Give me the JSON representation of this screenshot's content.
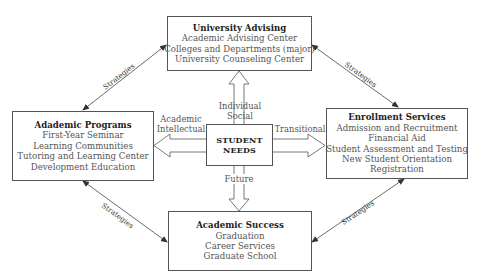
{
  "diagram": {
    "boxes": {
      "university_advising": {
        "title": "University Advising",
        "items": [
          "Academic Advising Center",
          "Colleges and Departments (major)",
          "University Counseling Center"
        ]
      },
      "academic_programs": {
        "title": "Adademic Programs",
        "items": [
          "First-Year Seminar",
          "Learning Communities",
          "Tutoring and Learning Center",
          "Development Education"
        ]
      },
      "student_needs": {
        "line1": "STUDENT",
        "line2": "NEEDS"
      },
      "enrollment_services": {
        "title": "Enrollment Services",
        "items": [
          "Admission and Recruitment",
          "Financial Aid",
          "Student Assessment and Testing",
          "New Student Orientation",
          "Registration"
        ]
      },
      "academic_success": {
        "title": "Academic Success",
        "items": [
          "Graduation",
          "Career Services",
          "Graduate School"
        ]
      }
    },
    "need_labels": {
      "up_1": "Individual",
      "up_2": "Social",
      "left_1": "Academic",
      "left_2": "Intellectual",
      "right": "Transitional",
      "down": "Future"
    },
    "connector_label": "Strategies",
    "colors": {
      "line": "#555555",
      "text": "#444444",
      "title": "#222222"
    }
  }
}
